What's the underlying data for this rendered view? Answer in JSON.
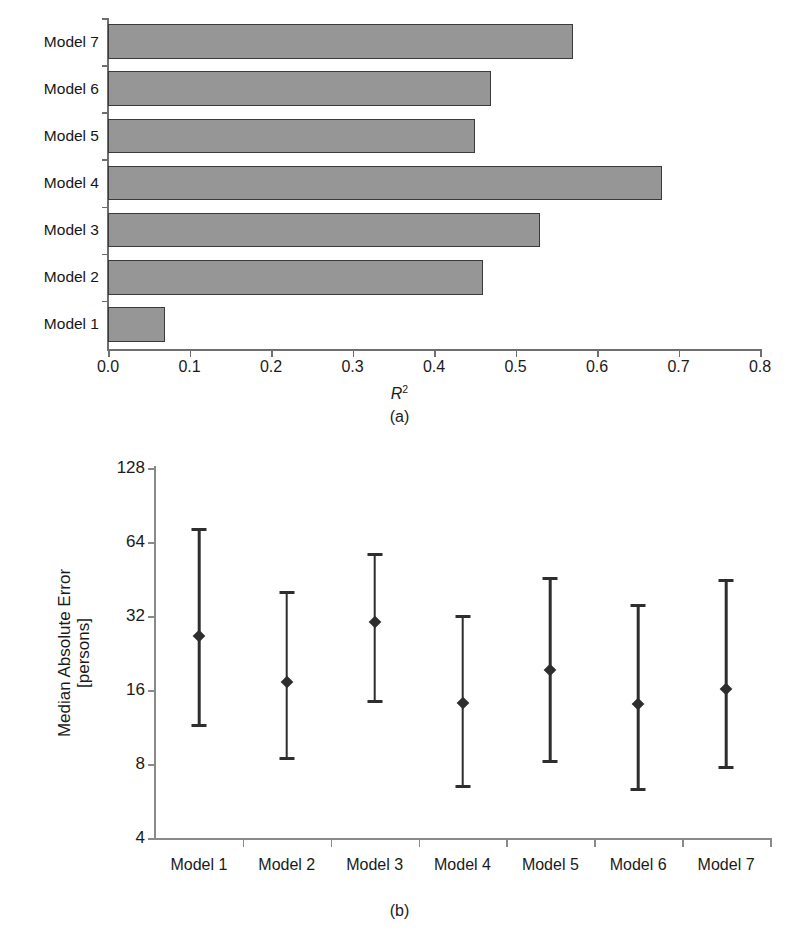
{
  "figure": {
    "panel_a_caption": "(a)",
    "panel_b_caption": "(b)"
  },
  "chart_data": [
    {
      "type": "bar",
      "orientation": "horizontal",
      "panel": "(a)",
      "title": "",
      "xlabel": "R²",
      "xlabel_base": "R",
      "xlabel_exp": "2",
      "ylabel": "",
      "categories": [
        "Model 1",
        "Model 2",
        "Model 3",
        "Model 4",
        "Model 5",
        "Model 6",
        "Model 7"
      ],
      "values": [
        0.07,
        0.46,
        0.53,
        0.68,
        0.45,
        0.47,
        0.57
      ],
      "xlim": [
        0.0,
        0.8
      ],
      "xticks": [
        0.0,
        0.1,
        0.2,
        0.3,
        0.4,
        0.5,
        0.6,
        0.7,
        0.8
      ],
      "xtick_labels": [
        "0.0",
        "0.1",
        "0.2",
        "0.3",
        "0.4",
        "0.5",
        "0.6",
        "0.7",
        "0.8"
      ],
      "grid": false,
      "legend": null,
      "bar_fill": "#969696",
      "bar_edge": "#3a3a3a"
    },
    {
      "type": "scatter",
      "subtype": "error-bar",
      "panel": "(b)",
      "title": "",
      "xlabel": "",
      "ylabel": "Median Absolute Error\n[persons]",
      "ylabel_line1": "Median Absolute Error",
      "ylabel_line2": "[persons]",
      "yscale": "log2",
      "ylim": [
        4,
        128
      ],
      "yticks": [
        4,
        8,
        16,
        32,
        64,
        128
      ],
      "ytick_labels": [
        "4",
        "8",
        "16",
        "32",
        "64",
        "128"
      ],
      "categories": [
        "Model 1",
        "Model 2",
        "Model 3",
        "Model 4",
        "Model 5",
        "Model 6",
        "Model 7"
      ],
      "values": [
        26.5,
        17.3,
        30.3,
        14.2,
        19.3,
        14.0,
        16.1
      ],
      "error_low": [
        11.3,
        8.3,
        14.2,
        6.4,
        8.1,
        6.2,
        7.6
      ],
      "error_high": [
        73.0,
        40.3,
        58.0,
        32.3,
        46.3,
        35.8,
        45.3
      ],
      "grid": false,
      "legend": null,
      "marker": "diamond",
      "marker_color": "#2e2e2e"
    }
  ]
}
